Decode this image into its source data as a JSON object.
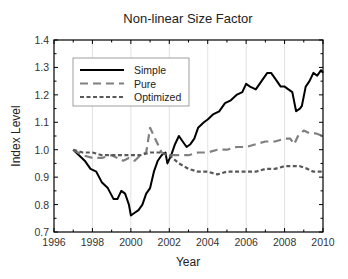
{
  "chart_data": {
    "type": "line",
    "title": "Non-linear Size Factor",
    "xlabel": "Year",
    "ylabel": "Index Level",
    "xlim": [
      1996,
      2010
    ],
    "ylim": [
      0.7,
      1.4
    ],
    "xticks": [
      1996,
      1998,
      2000,
      2002,
      2004,
      2006,
      2008,
      2010
    ],
    "yticks": [
      0.7,
      0.8,
      0.9,
      1.0,
      1.1,
      1.2,
      1.3,
      1.4
    ],
    "ytick_labels": [
      "0.7",
      "0.8",
      "0.9",
      "1.0",
      "1.1",
      "1.2",
      "1.3",
      "1.4"
    ],
    "grid": "vertical",
    "legend_position": "upper left",
    "series": [
      {
        "name": "Simple",
        "style": "solid",
        "color": "#000000",
        "x": [
          1997.0,
          1997.3,
          1997.6,
          1997.9,
          1998.2,
          1998.5,
          1998.8,
          1999.1,
          1999.3,
          1999.5,
          1999.7,
          1999.9,
          2000.0,
          2000.2,
          2000.4,
          2000.6,
          2000.8,
          2001.0,
          2001.2,
          2001.4,
          2001.6,
          2001.8,
          2001.9,
          2002.1,
          2002.3,
          2002.5,
          2002.7,
          2002.9,
          2003.1,
          2003.3,
          2003.5,
          2003.8,
          2004.0,
          2004.3,
          2004.6,
          2004.9,
          2005.2,
          2005.5,
          2005.8,
          2006.0,
          2006.2,
          2006.5,
          2006.8,
          2007.1,
          2007.3,
          2007.5,
          2007.8,
          2008.0,
          2008.2,
          2008.4,
          2008.6,
          2008.8,
          2008.9,
          2009.1,
          2009.3,
          2009.5,
          2009.7,
          2009.9,
          2010.0
        ],
        "values": [
          1.0,
          0.98,
          0.96,
          0.93,
          0.92,
          0.88,
          0.86,
          0.82,
          0.82,
          0.85,
          0.84,
          0.8,
          0.76,
          0.77,
          0.78,
          0.8,
          0.84,
          0.86,
          0.92,
          0.96,
          0.98,
          0.99,
          0.95,
          0.98,
          1.02,
          1.05,
          1.03,
          1.01,
          1.02,
          1.04,
          1.08,
          1.1,
          1.11,
          1.13,
          1.14,
          1.17,
          1.18,
          1.2,
          1.21,
          1.24,
          1.23,
          1.22,
          1.25,
          1.28,
          1.28,
          1.26,
          1.23,
          1.23,
          1.22,
          1.21,
          1.14,
          1.15,
          1.16,
          1.23,
          1.25,
          1.28,
          1.27,
          1.29,
          1.28
        ]
      },
      {
        "name": "Pure",
        "style": "dashed-long",
        "color": "#808080",
        "x": [
          1997.0,
          1997.5,
          1998.0,
          1998.5,
          1999.0,
          1999.3,
          1999.6,
          1999.9,
          2000.2,
          2000.5,
          2000.8,
          2001.0,
          2001.2,
          2001.4,
          2001.6,
          2001.9,
          2002.2,
          2002.6,
          2003.0,
          2003.5,
          2004.0,
          2004.5,
          2005.0,
          2005.5,
          2006.0,
          2006.5,
          2007.0,
          2007.5,
          2008.0,
          2008.3,
          2008.5,
          2008.7,
          2009.0,
          2009.3,
          2009.6,
          2010.0
        ],
        "values": [
          1.0,
          0.98,
          0.97,
          0.97,
          0.98,
          0.97,
          0.96,
          0.97,
          0.96,
          0.98,
          0.99,
          1.08,
          1.05,
          1.02,
          0.99,
          0.98,
          0.98,
          0.98,
          0.98,
          0.99,
          0.99,
          1.0,
          1.0,
          1.01,
          1.01,
          1.02,
          1.03,
          1.03,
          1.04,
          1.04,
          1.02,
          1.05,
          1.07,
          1.06,
          1.06,
          1.05
        ]
      },
      {
        "name": "Optimized",
        "style": "dashed-short",
        "color": "#595959",
        "x": [
          1997.0,
          1997.5,
          1998.0,
          1998.5,
          1999.0,
          1999.5,
          2000.0,
          2000.5,
          2001.0,
          2001.5,
          2002.0,
          2002.5,
          2003.0,
          2003.5,
          2004.0,
          2004.5,
          2005.0,
          2005.5,
          2006.0,
          2006.5,
          2007.0,
          2007.5,
          2008.0,
          2008.5,
          2008.8,
          2009.2,
          2009.5,
          2010.0
        ],
        "values": [
          1.0,
          0.99,
          0.99,
          0.98,
          0.98,
          0.98,
          0.98,
          0.98,
          0.99,
          0.99,
          0.98,
          0.95,
          0.93,
          0.92,
          0.92,
          0.91,
          0.92,
          0.92,
          0.92,
          0.92,
          0.93,
          0.93,
          0.94,
          0.94,
          0.94,
          0.93,
          0.92,
          0.92
        ]
      }
    ]
  }
}
